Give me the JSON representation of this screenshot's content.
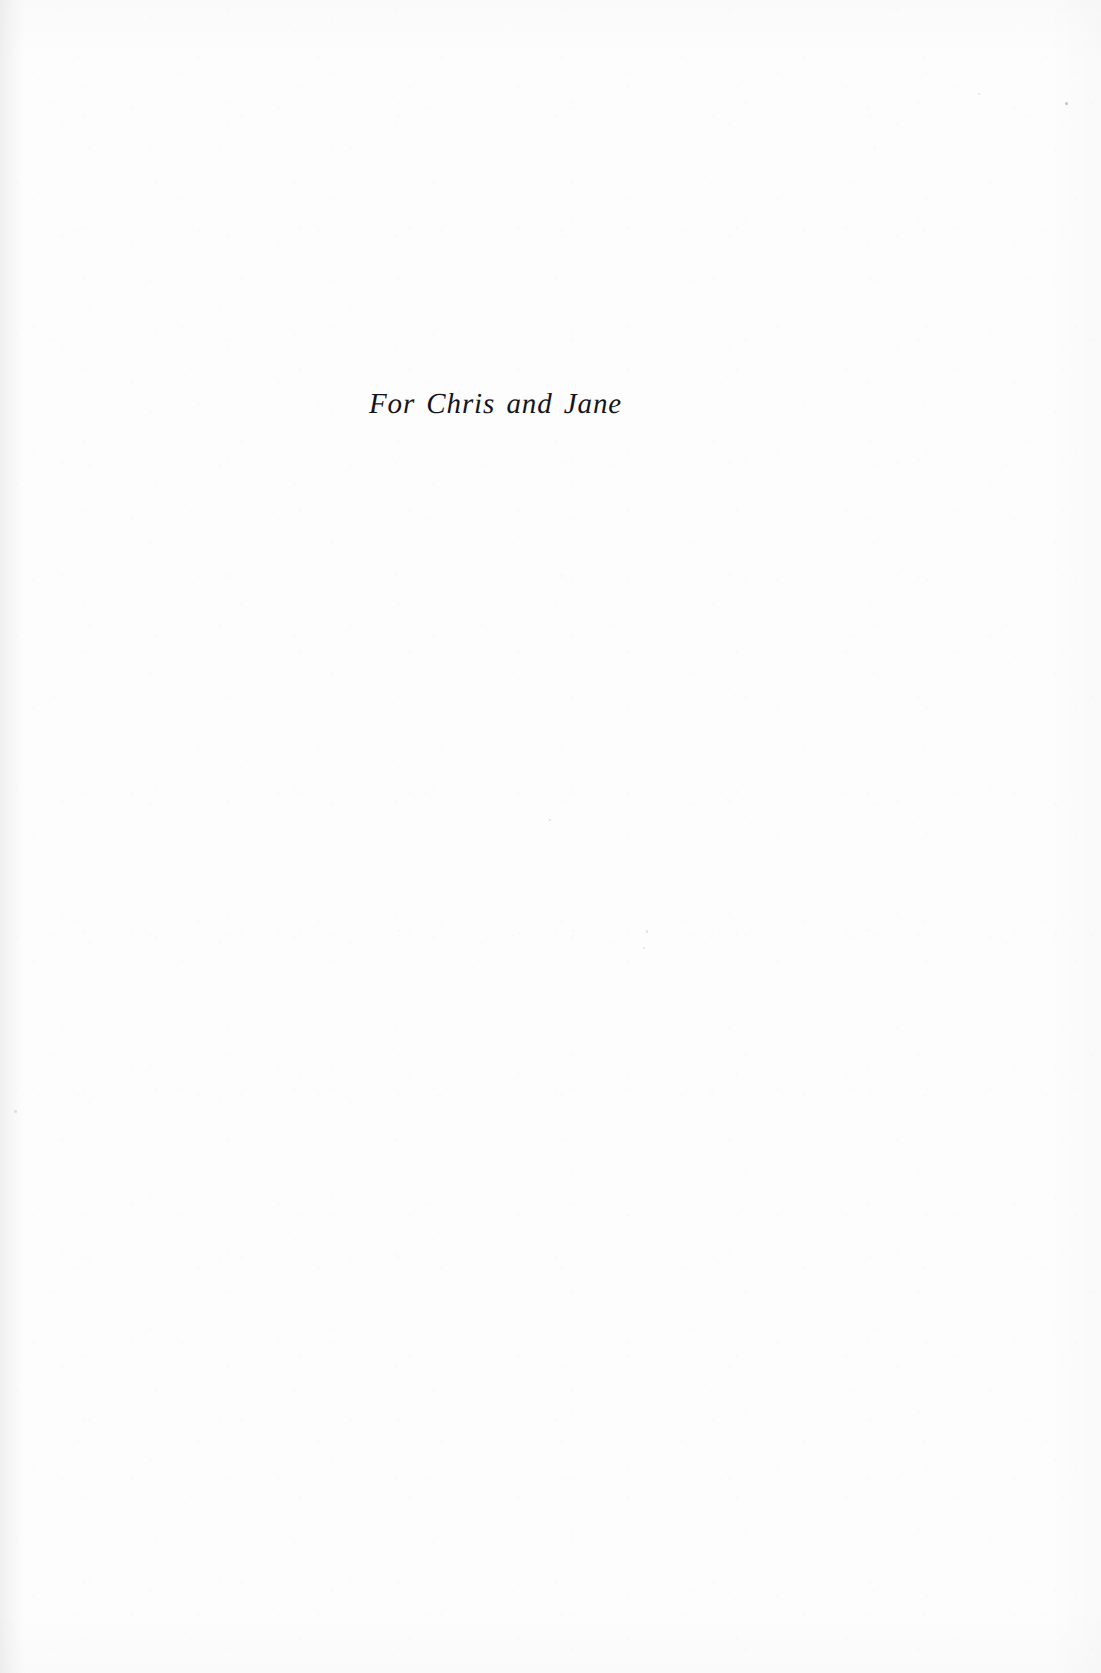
{
  "page": {
    "kind": "book-dedication-page",
    "background_color": "#fdfdfd",
    "text_color": "#15151a",
    "width": 1101,
    "height": 1673
  },
  "dedication": {
    "text": "For Chris and Jane",
    "style": "italic-serif",
    "alignment": "center",
    "font_size_px": 29
  },
  "artifacts": {
    "gutter_shadow": "left-edge",
    "grain": "faint-scan-noise",
    "specks": 6
  }
}
